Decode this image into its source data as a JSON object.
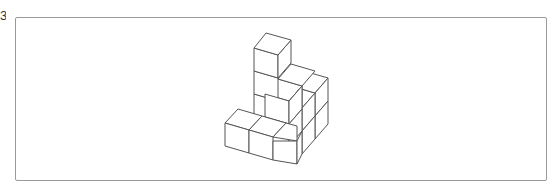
{
  "question_label": "3",
  "figure": {
    "stroke_color": "#555555",
    "fill_color": "#ffffff",
    "frame_color": "#9a9a9a"
  }
}
